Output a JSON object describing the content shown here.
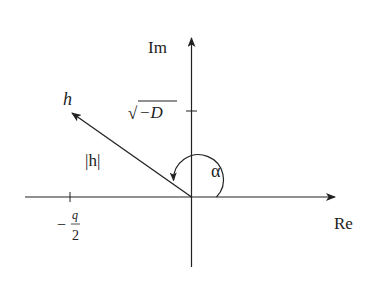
{
  "diagram": {
    "type": "complex-plane",
    "colors": {
      "stroke": "#222222",
      "background": "#ffffff"
    },
    "axes": {
      "real_label": "Re",
      "imag_label": "Im"
    },
    "ticks": {
      "real_tick": {
        "label_minus": "−",
        "label_num": "q",
        "label_den": "2"
      },
      "imag_tick": {
        "label_sqrt": "√",
        "label_inner": "−D"
      }
    },
    "vector": {
      "label": "h",
      "magnitude_label": "|h|"
    },
    "angle": {
      "label": "α"
    }
  }
}
